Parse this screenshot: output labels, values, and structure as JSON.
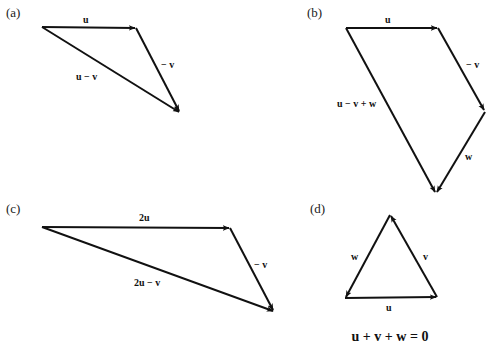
{
  "figure": {
    "panels": [
      {
        "id": "a",
        "label": "(a)",
        "vectors": [
          {
            "name": "u",
            "label": "u"
          },
          {
            "name": "neg-v",
            "label": "− v"
          },
          {
            "name": "u-minus-v",
            "label": "u − v"
          }
        ]
      },
      {
        "id": "b",
        "label": "(b)",
        "vectors": [
          {
            "name": "u",
            "label": "u"
          },
          {
            "name": "neg-v",
            "label": "− v"
          },
          {
            "name": "w",
            "label": "w"
          },
          {
            "name": "u-minus-v-plus-w",
            "label": "u − v + w"
          }
        ]
      },
      {
        "id": "c",
        "label": "(c)",
        "vectors": [
          {
            "name": "2u",
            "label": "2u"
          },
          {
            "name": "neg-v",
            "label": "− v"
          },
          {
            "name": "2u-minus-v",
            "label": "2u − v"
          }
        ]
      },
      {
        "id": "d",
        "label": "(d)",
        "vectors": [
          {
            "name": "u",
            "label": "u"
          },
          {
            "name": "v",
            "label": "v"
          },
          {
            "name": "w",
            "label": "w"
          }
        ],
        "equation": "u + v + w = 0"
      }
    ]
  }
}
